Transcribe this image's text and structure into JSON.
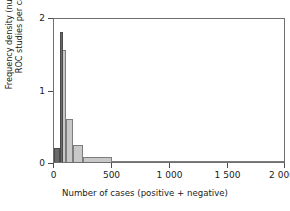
{
  "chart_data": {
    "type": "bar",
    "title": "",
    "subtitle": "",
    "xlabel": "Number of cases (positive + negative)",
    "ylabel": "Frequency density (number of ROC studies per case)",
    "ylabel_line1": "Frequency density (number of",
    "ylabel_line2": "ROC studies per case)",
    "xlim": [
      0,
      2000
    ],
    "ylim": [
      0,
      2
    ],
    "grid": false,
    "legend": null,
    "xticks": [
      0,
      500,
      1000,
      1500,
      2000
    ],
    "xticklabels": [
      "0",
      "500",
      "1 000",
      "1 500",
      "2 000"
    ],
    "yticks": [
      0,
      1,
      2
    ],
    "yticklabels": [
      "0",
      "1",
      "2"
    ],
    "bin_edges": [
      0,
      50,
      100,
      150,
      250,
      350,
      500,
      1000,
      1500,
      2000
    ],
    "values": [
      0.2,
      1.8,
      1.55,
      0.6,
      0.23,
      0.07,
      0.02,
      0.005,
      0.005
    ],
    "bars": [
      {
        "x0": 0,
        "x1": 50,
        "value": 0.2,
        "shade": "dark"
      },
      {
        "x0": 50,
        "x1": 80,
        "value": 1.8,
        "shade": "dark"
      },
      {
        "x0": 60,
        "x1": 100,
        "value": 1.55,
        "shade": "light"
      },
      {
        "x0": 100,
        "x1": 160,
        "value": 0.6,
        "shade": "light"
      },
      {
        "x0": 160,
        "x1": 250,
        "value": 0.23,
        "shade": "light"
      },
      {
        "x0": 250,
        "x1": 500,
        "value": 0.07,
        "shade": "light"
      },
      {
        "x0": 500,
        "x1": 1000,
        "value": 0.02,
        "shade": "light"
      },
      {
        "x0": 1000,
        "x1": 2000,
        "value": 0.006,
        "shade": "light"
      }
    ],
    "colors": {
      "bar_fill_light": "#c8c8c8",
      "bar_fill_dark": "#6a6a6a",
      "bar_edge": "#7d7d7d",
      "axis": "#6f6f6f",
      "text": "#1b1b1b",
      "background": "#ffffff"
    }
  }
}
